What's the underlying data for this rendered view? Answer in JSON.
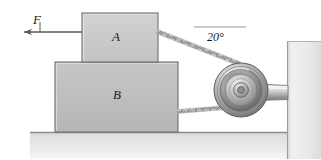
{
  "figure": {
    "background_color": "#ffffff"
  },
  "labels": {
    "block_a": "A",
    "block_b": "B",
    "force": "F",
    "angle": "20°"
  },
  "colors": {
    "block_a_fill": "#c9c9c9",
    "block_b_fill": "#bdbdbd",
    "ground_fill": "#e2e2e2",
    "wall_fill": "#e9e9e9",
    "outline": "#6f6f6f",
    "rope": "#8a8a8a",
    "pulley_metal": "#b9b9b9",
    "arrow": "#5a5a5a",
    "text": "#1a1a1a"
  },
  "geometry": {
    "canvas_width": 321,
    "canvas_height": 159,
    "block_a": {
      "x": 82,
      "y": 13,
      "width": 76,
      "height": 49
    },
    "block_b": {
      "x": 55,
      "y": 62,
      "width": 123,
      "height": 70
    },
    "ground": {
      "x": 30,
      "y": 132,
      "width": 291,
      "height": 27
    },
    "wall": {
      "x": 287,
      "y": 41,
      "width": 34,
      "height": 118
    },
    "pulley": {
      "cx": 241,
      "cy": 90,
      "radius": 27
    },
    "force_arrow": {
      "from_x": 82,
      "from_y": 32,
      "to_x": 22,
      "to_y": 32
    },
    "upper_rope": {
      "from_x": 158,
      "from_y": 32,
      "to_x": 238,
      "to_y": 64
    },
    "lower_rope": {
      "from_x": 178,
      "from_y": 111,
      "to_x": 232,
      "to_y": 108
    },
    "angle_reference_line": {
      "from_x": 194,
      "from_y": 27,
      "to_x": 245,
      "to_y": 27
    },
    "support_rod": {
      "from_x": 241,
      "from_y": 92,
      "to_x": 288,
      "to_y": 92
    }
  },
  "annotations": {
    "angle_value_degrees": 20,
    "angle_description": "Angle between upper rope and horizontal reference"
  }
}
